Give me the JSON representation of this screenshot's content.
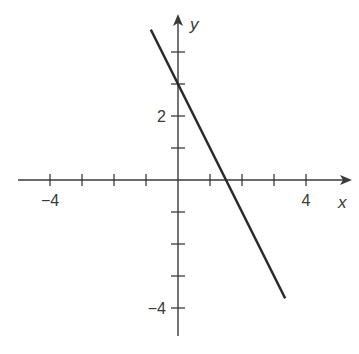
{
  "chart_data": {
    "type": "line",
    "title": "",
    "xlabel": "x",
    "ylabel": "y",
    "xlim": [
      -5,
      5.4
    ],
    "ylim": [
      -4.9,
      4.8
    ],
    "grid": false,
    "legend": null,
    "x_ticks": [
      -4,
      -3,
      -2,
      -1,
      1,
      2,
      3,
      4
    ],
    "y_ticks": [
      4,
      3,
      2,
      1,
      -1,
      -2,
      -3,
      -4
    ],
    "x_tick_labels": [
      {
        "value": -4,
        "label": "−4"
      },
      {
        "value": 4,
        "label": "4"
      }
    ],
    "y_tick_labels": [
      {
        "value": 2,
        "label": "2"
      },
      {
        "value": -4,
        "label": "−4"
      }
    ],
    "series": [
      {
        "name": "y = -2x + 3",
        "equation": "y = -2x + 3",
        "slope": -2,
        "y_intercept": 3,
        "x_intercept": 1.5,
        "x": [
          -0.85,
          3.35
        ],
        "values": [
          4.7,
          -3.7
        ],
        "color": "#2a2a2a"
      }
    ]
  },
  "colors": {
    "axis": "#3a3a3a",
    "line": "#2a2a2a",
    "background": "#ffffff"
  }
}
